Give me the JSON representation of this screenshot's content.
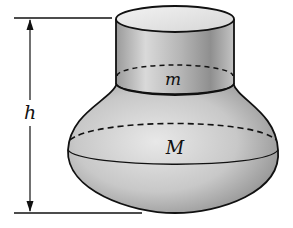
{
  "diagram": {
    "labels": {
      "height": "h",
      "small_mass": "m",
      "large_mass": "M"
    },
    "colors": {
      "stroke": "#111111",
      "fill_light": "#e6e6e6",
      "fill_mid": "#bdbdbd",
      "fill_dark": "#7a7a7a",
      "background": "#ffffff"
    },
    "parts": {
      "top_cylinder": "cylinder of mass m",
      "bottom_bulb": "bulb of mass M",
      "dimension": "height h"
    }
  }
}
